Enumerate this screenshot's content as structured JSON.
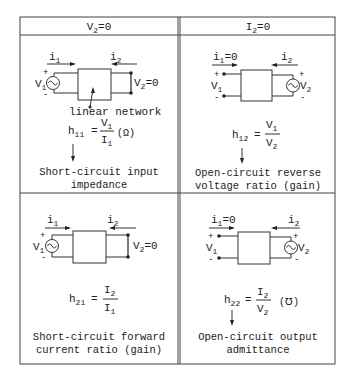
{
  "table": {
    "headers": [
      {
        "label_main": "V",
        "label_sub": "2",
        "label_rest": "=0"
      },
      {
        "label_main": "I",
        "label_sub": "2",
        "label_rest": "=0"
      }
    ],
    "cells": [
      {
        "id": "h11",
        "condition": "V2=0",
        "circuit": {
          "i1": {
            "main": "i",
            "sub": "1",
            "rest": ""
          },
          "i2": {
            "main": "i",
            "sub": "2",
            "rest": ""
          },
          "source_side": "input",
          "plus": "+",
          "minus": "-",
          "v_source": {
            "main": "V",
            "sub": "1"
          },
          "v_other": {
            "main": "V",
            "sub": "2",
            "rest": "=0"
          },
          "annotation": "linear network"
        },
        "param": {
          "main": "h",
          "sub": "11"
        },
        "equals": "=",
        "numerator": {
          "main": "V",
          "sub": "1"
        },
        "denominator": {
          "main": "I",
          "sub": "1"
        },
        "unit": "(Ω)",
        "arrow": "down-arrow",
        "description_line1": "Short-circuit input",
        "description_line2": "impedance"
      },
      {
        "id": "h12",
        "condition": "I2=0",
        "circuit": {
          "i1": {
            "main": "i",
            "sub": "1",
            "rest": "=0"
          },
          "i2": {
            "main": "i",
            "sub": "2",
            "rest": ""
          },
          "source_side": "output",
          "plus": "+",
          "minus": "-",
          "v_open": {
            "main": "V",
            "sub": "1"
          },
          "v_source": {
            "main": "V",
            "sub": "2"
          }
        },
        "param": {
          "main": "h",
          "sub": "12"
        },
        "equals": "=",
        "numerator": {
          "main": "V",
          "sub": "1"
        },
        "denominator": {
          "main": "V",
          "sub": "2"
        },
        "unit": "",
        "arrow": "down-arrow",
        "description_line1": "Open-circuit reverse",
        "description_line2": "voltage ratio (gain)"
      },
      {
        "id": "h21",
        "condition": "V2=0",
        "circuit": {
          "i1": {
            "main": "i",
            "sub": "1",
            "rest": ""
          },
          "i2": {
            "main": "i",
            "sub": "2",
            "rest": ""
          },
          "source_side": "input",
          "plus": "+",
          "minus": "-",
          "v_source": {
            "main": "V",
            "sub": "1"
          },
          "v_other": {
            "main": "V",
            "sub": "2",
            "rest": "=0"
          }
        },
        "param": {
          "main": "h",
          "sub": "21"
        },
        "equals": "=",
        "numerator": {
          "main": "I",
          "sub": "2"
        },
        "denominator": {
          "main": "I",
          "sub": "1"
        },
        "unit": "",
        "description_line1": "Short-circuit forward",
        "description_line2": "current ratio (gain)"
      },
      {
        "id": "h22",
        "condition": "I2=0",
        "circuit": {
          "i1": {
            "main": "i",
            "sub": "1",
            "rest": "=0"
          },
          "i2": {
            "main": "i",
            "sub": "2",
            "rest": ""
          },
          "source_side": "output",
          "plus": "+",
          "minus": "-",
          "v_open": {
            "main": "V",
            "sub": "1"
          },
          "v_source": {
            "main": "V",
            "sub": "2"
          }
        },
        "param": {
          "main": "h",
          "sub": "22"
        },
        "equals": "=",
        "numerator": {
          "main": "I",
          "sub": "2"
        },
        "denominator": {
          "main": "V",
          "sub": "2"
        },
        "unit": "(℧)",
        "arrow": "down-arrow",
        "description_line1": "Open-circuit output",
        "description_line2": "admittance"
      }
    ]
  },
  "colors": {
    "ink": "#222222",
    "background": "#ffffff"
  }
}
